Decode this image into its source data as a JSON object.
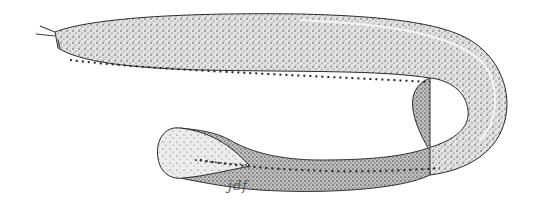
{
  "illustration": {
    "subject": "hagfish",
    "style": "stipple pen-and-ink drawing",
    "signature": "jdf",
    "colors": {
      "background": "#ffffff",
      "ink": "#2a2a2a",
      "body_fill": "#cfcfcf",
      "highlight": "#f4f4f4"
    }
  }
}
